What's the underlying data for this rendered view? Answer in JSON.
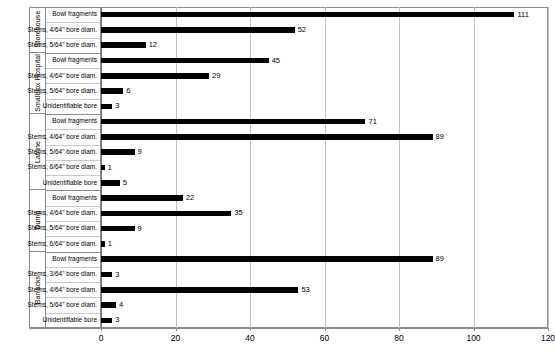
{
  "title_sliver": "",
  "chart_data": {
    "type": "bar",
    "orientation": "horizontal",
    "title": "",
    "xlabel": "",
    "ylabel": "",
    "xlim": [
      0,
      120
    ],
    "xticks": [
      0,
      20,
      40,
      60,
      80,
      100,
      120
    ],
    "xtick_labels": [
      "0",
      "20",
      "40",
      "60",
      "80",
      "100",
      "120"
    ],
    "grid": true,
    "grid_axis": "x",
    "legend": false,
    "bar_color": "#000000",
    "groups": [
      {
        "name": "Storehouse",
        "categories": [
          "Bowl fragments",
          "Stems, 4/64\" bore diam.",
          "Stems, 5/64\" bore diam."
        ],
        "values": [
          111,
          52,
          12
        ]
      },
      {
        "name": "Smallpox Hospital",
        "categories": [
          "Bowl fragments",
          "Stems, 4/64\" bore diam.",
          "Stems, 5/64\" bore diam.",
          "Unidentifiable bore"
        ],
        "values": [
          45,
          29,
          6,
          3
        ]
      },
      {
        "name": "Latrine",
        "categories": [
          "Bowl fragments",
          "Stems, 4/64\" bore diam.",
          "Stems, 5/64\" bore diam.",
          "Stems, 6/64\" bore diam.",
          "Unidentifiable bore"
        ],
        "values": [
          71,
          89,
          9,
          1,
          5
        ]
      },
      {
        "name": "Dump",
        "categories": [
          "Bowl fragments",
          "Stems, 4/64\" bore diam.",
          "Stems, 5/64\" bore diam.",
          "Stems, 6/64\" bore diam."
        ],
        "values": [
          22,
          35,
          9,
          1
        ]
      },
      {
        "name": "Barracks",
        "categories": [
          "Bowl fragments",
          "Stems, 3/64\" bore diam.",
          "Stems, 4/64\" bore diam.",
          "Stems, 5/64\" bore diam.",
          "Unidentifiable bore"
        ],
        "values": [
          89,
          3,
          53,
          4,
          3
        ]
      }
    ]
  }
}
